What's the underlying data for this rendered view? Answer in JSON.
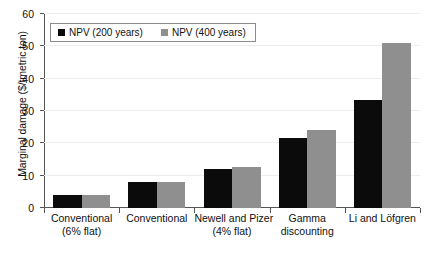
{
  "chart_data": {
    "type": "bar",
    "title": "",
    "xlabel": "",
    "ylabel": "Marginal damage ($/tmetric ton)",
    "ylim": [
      0,
      60
    ],
    "yticks": [
      0,
      10,
      20,
      30,
      40,
      50,
      60
    ],
    "ytick_labels": [
      "0",
      "10",
      "20",
      "30",
      "40",
      "50",
      "60"
    ],
    "grid": true,
    "legend_position": "top-left",
    "categories": [
      "Conventional\n(6% flat)",
      "Conventional",
      "Newell and Pizer\n(4% flat)",
      "Gamma\ndiscounting",
      "Li and Löfgren"
    ],
    "category_lines": [
      [
        "Conventional",
        "(6% flat)"
      ],
      [
        "Conventional",
        ""
      ],
      [
        "Newell and Pizer",
        "(4% flat)"
      ],
      [
        "Gamma",
        "discounting"
      ],
      [
        "Li and Löfgren",
        ""
      ]
    ],
    "series": [
      {
        "name": "NPV (200 years)",
        "color": "#0b0b0b",
        "values": [
          4.0,
          8.2,
          12.0,
          21.5,
          33.3
        ]
      },
      {
        "name": "NPV (400 years)",
        "color": "#8f8f8f",
        "values": [
          4.0,
          8.1,
          12.7,
          24.2,
          51.0
        ]
      }
    ]
  },
  "legend": {
    "items": [
      {
        "label": "NPV (200 years)"
      },
      {
        "label": "NPV (400 years)"
      }
    ]
  },
  "axis": {
    "y_title": "Marginal damage ($/tmetric ton)"
  }
}
